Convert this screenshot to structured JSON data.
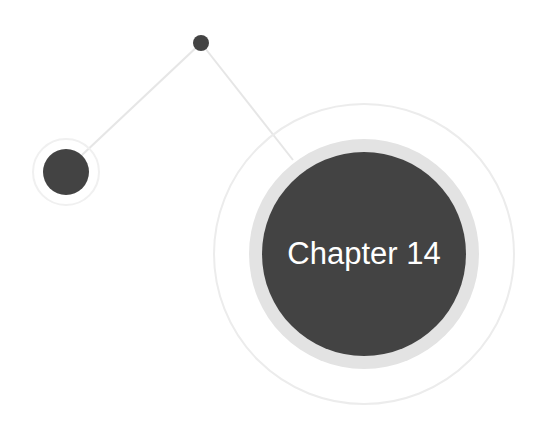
{
  "title": "Chapter 14",
  "colors": {
    "background": "#ffffff",
    "node_fill": "#434343",
    "halo": "#e3e3e3",
    "faint_ring": "#ececec",
    "connector": "#e6e6e6",
    "label_text": "#ffffff"
  },
  "nodes": [
    {
      "id": "small-dot",
      "cx": 201,
      "cy": 43,
      "r": 8
    },
    {
      "id": "left-node",
      "cx": 66,
      "cy": 172,
      "r": 23,
      "outer_ring_r": 33
    },
    {
      "id": "chapter-node",
      "cx": 364,
      "cy": 254,
      "r": 102,
      "halo_r": 115,
      "outer_ring_r": 150,
      "label": "Chapter 14"
    }
  ]
}
